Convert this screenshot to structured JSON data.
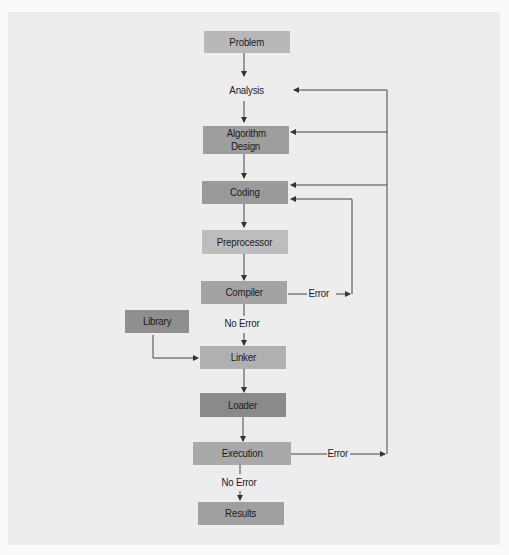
{
  "diagram": {
    "type": "flowchart",
    "colors": {
      "background": "#ededed",
      "light_box": "#b9b9b9",
      "mid_box": "#a5a5a5",
      "dark_box": "#8c8c8c",
      "line": "#333333"
    },
    "nodes": [
      {
        "id": "problem",
        "label": "Problem"
      },
      {
        "id": "analysis",
        "label": "Analysis"
      },
      {
        "id": "algorithm_design",
        "label": "Algorithm Design",
        "lines": [
          "Algorithm",
          "Design"
        ]
      },
      {
        "id": "coding",
        "label": "Coding"
      },
      {
        "id": "preprocessor",
        "label": "Preprocessor"
      },
      {
        "id": "compiler",
        "label": "Compiler"
      },
      {
        "id": "library",
        "label": "Library"
      },
      {
        "id": "linker",
        "label": "Linker"
      },
      {
        "id": "loader",
        "label": "Loader"
      },
      {
        "id": "execution",
        "label": "Execution"
      },
      {
        "id": "results",
        "label": "Results"
      }
    ],
    "edge_labels": {
      "compiler_error": "Error",
      "compiler_no_error": "No Error",
      "execution_error": "Error",
      "execution_no_error": "No Error"
    },
    "edges": [
      {
        "from": "problem",
        "to": "analysis"
      },
      {
        "from": "analysis",
        "to": "algorithm_design"
      },
      {
        "from": "algorithm_design",
        "to": "coding"
      },
      {
        "from": "coding",
        "to": "preprocessor"
      },
      {
        "from": "preprocessor",
        "to": "compiler"
      },
      {
        "from": "compiler",
        "to": "coding",
        "label": "Error"
      },
      {
        "from": "compiler",
        "to": "linker",
        "label": "No Error"
      },
      {
        "from": "library",
        "to": "linker"
      },
      {
        "from": "linker",
        "to": "loader"
      },
      {
        "from": "loader",
        "to": "execution"
      },
      {
        "from": "execution",
        "to": "analysis",
        "label": "Error"
      },
      {
        "from": "execution",
        "to": "algorithm_design",
        "label": "Error"
      },
      {
        "from": "execution",
        "to": "coding",
        "label": "Error"
      },
      {
        "from": "execution",
        "to": "results",
        "label": "No Error"
      }
    ]
  }
}
